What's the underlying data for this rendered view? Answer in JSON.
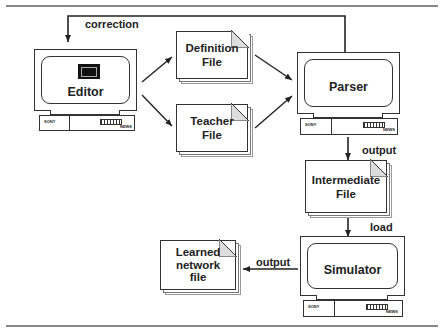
{
  "diagram": {
    "nodes": {
      "editor": {
        "label": "Editor",
        "type": "workstation"
      },
      "definition_file": {
        "label_line1": "Definition",
        "label_line2": "File",
        "type": "file"
      },
      "teacher_file": {
        "label_line1": "Teacher",
        "label_line2": "File",
        "type": "file"
      },
      "parser": {
        "label": "Parser",
        "type": "workstation"
      },
      "intermediate_file": {
        "label_line1": "Intermediate",
        "label_line2": "File",
        "type": "file"
      },
      "simulator": {
        "label": "Simulator",
        "type": "workstation"
      },
      "learned_network_file": {
        "label_line1": "Learned",
        "label_line2": "network",
        "label_line3": "file",
        "type": "file"
      }
    },
    "edges": [
      {
        "from": "parser",
        "to": "editor",
        "label": "correction"
      },
      {
        "from": "editor",
        "to": "definition_file",
        "label": ""
      },
      {
        "from": "editor",
        "to": "teacher_file",
        "label": ""
      },
      {
        "from": "definition_file",
        "to": "parser",
        "label": ""
      },
      {
        "from": "teacher_file",
        "to": "parser",
        "label": ""
      },
      {
        "from": "parser",
        "to": "intermediate_file",
        "label": "output"
      },
      {
        "from": "intermediate_file",
        "to": "simulator",
        "label": "load"
      },
      {
        "from": "simulator",
        "to": "learned_network_file",
        "label": "output"
      }
    ],
    "edge_labels": {
      "correction": "correction",
      "parser_output": "output",
      "load": "load",
      "simulator_output": "output"
    },
    "workstation_brand": "SONY",
    "workstation_model": "NEWS"
  }
}
